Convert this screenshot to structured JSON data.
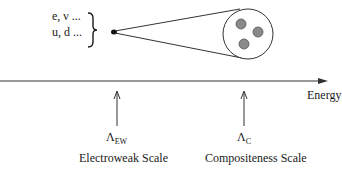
{
  "particles": {
    "line1": "e, ν ...",
    "line2": "u, d ..."
  },
  "axis": {
    "label": "Energy"
  },
  "scales": [
    {
      "symbol": "Λ",
      "subscript": "EW",
      "name": "Electroweak Scale"
    },
    {
      "symbol": "Λ",
      "subscript": "C",
      "name": "Compositeness Scale"
    }
  ],
  "composite": {
    "constituent_count": 3
  }
}
